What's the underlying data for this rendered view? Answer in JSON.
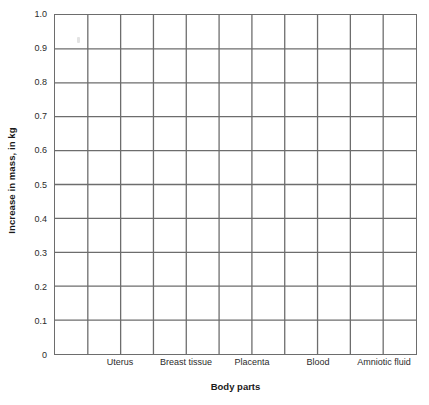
{
  "chart_data": {
    "type": "bar",
    "title": "",
    "subtitle": "",
    "xlabel": "Body parts",
    "ylabel": "Increase in mass, in kg",
    "categories": [
      "Uterus",
      "Breast tissue",
      "Placenta",
      "Blood",
      "Amniotic fluid"
    ],
    "values": [
      null,
      null,
      null,
      null,
      null
    ],
    "series": [],
    "ylim": [
      0,
      1.0
    ],
    "ytick_labels": [
      "1.0",
      "0.9",
      "0.8",
      "0.7",
      "0.6",
      "0.5",
      "0.4",
      "0.3",
      "0.2",
      "0.1",
      "0"
    ],
    "ytick_values": [
      1.0,
      0.9,
      0.8,
      0.7,
      0.6,
      0.5,
      0.4,
      0.3,
      0.2,
      0.1,
      0
    ],
    "grid": true,
    "grid_columns": 11,
    "grid_rows": 10,
    "legend": null,
    "legend_position": "none",
    "annotations": [],
    "note": "Blank grid — no bars plotted"
  },
  "axes": {
    "y_title": "Increase in mass, in kg",
    "x_title": "Body parts"
  },
  "colors": {
    "grid_line": "#6d6d6d",
    "axis_line": "#5a5a5a",
    "text": "#2b2b2b",
    "title_text": "#1a1a1a",
    "background": "#ffffff"
  }
}
